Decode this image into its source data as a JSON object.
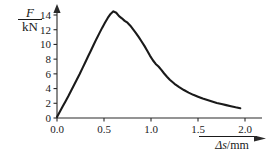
{
  "chart_data": {
    "type": "line",
    "title": "",
    "subtitle": "",
    "xlabel": "Δs/mm",
    "ylabel": "F/kN",
    "ylabel_numerator": "F",
    "ylabel_denominator": "kN",
    "xlabel_symbol": "Δs",
    "xlabel_unit": "mm",
    "xlim": [
      0.0,
      2.1
    ],
    "ylim": [
      0,
      15
    ],
    "xticks": [
      0.0,
      0.5,
      1.0,
      1.5,
      2.0
    ],
    "xticklabels": [
      "0.0",
      "0.5",
      "1.0",
      "1.5",
      "2.0"
    ],
    "yticks": [
      0,
      2,
      4,
      6,
      8,
      10,
      12,
      14
    ],
    "yticklabels": [
      "0",
      "2",
      "4",
      "6",
      "8",
      "10",
      "12",
      "14"
    ],
    "grid": false,
    "legend": false,
    "legend_position": "none",
    "line_color": "#1a1a1a",
    "background_color": "#ffffff",
    "axis_color": "#2a2a2a",
    "series": [
      {
        "name": "Force-displacement",
        "x": [
          0.0,
          0.03,
          0.06,
          0.09,
          0.12,
          0.15,
          0.18,
          0.21,
          0.24,
          0.27,
          0.3,
          0.33,
          0.36,
          0.39,
          0.42,
          0.45,
          0.48,
          0.51,
          0.54,
          0.57,
          0.6,
          0.63,
          0.66,
          0.69,
          0.72,
          0.75,
          0.78,
          0.81,
          0.84,
          0.87,
          0.9,
          0.93,
          0.96,
          0.99,
          1.02,
          1.05,
          1.08,
          1.11,
          1.14,
          1.17,
          1.2,
          1.25,
          1.3,
          1.35,
          1.4,
          1.45,
          1.5,
          1.55,
          1.6,
          1.65,
          1.7,
          1.75,
          1.8,
          1.85,
          1.9,
          1.95
        ],
        "y": [
          0.15,
          0.85,
          1.55,
          2.25,
          2.95,
          3.7,
          4.45,
          5.2,
          5.95,
          6.75,
          7.55,
          8.35,
          9.15,
          9.95,
          10.75,
          11.5,
          12.25,
          12.95,
          13.6,
          14.15,
          14.5,
          14.3,
          13.85,
          13.55,
          13.2,
          12.95,
          12.55,
          12.05,
          11.55,
          11.0,
          10.4,
          9.8,
          9.15,
          8.45,
          7.85,
          7.35,
          7.0,
          6.55,
          6.05,
          5.6,
          5.2,
          4.65,
          4.2,
          3.8,
          3.45,
          3.15,
          2.9,
          2.65,
          2.45,
          2.25,
          2.05,
          1.9,
          1.75,
          1.6,
          1.45,
          1.32
        ]
      }
    ],
    "annotations": {
      "peak_value": 14.5,
      "peak_x": 0.6
    }
  }
}
